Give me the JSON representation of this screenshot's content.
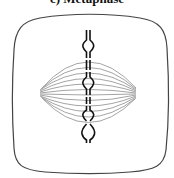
{
  "caption": {
    "text": "c) Metaphase"
  },
  "diagram": {
    "colors": {
      "cell_outline": "#444444",
      "spindle_fiber": "#9a9a9a",
      "chromosome": "#111111"
    },
    "chromosome_count": 5
  }
}
